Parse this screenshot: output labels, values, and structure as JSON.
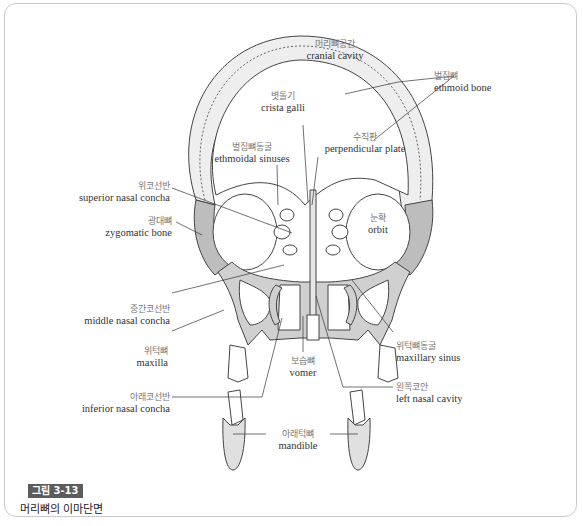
{
  "figure": {
    "badge": "그림 3-13",
    "title": "머리뼈의 이마단면"
  },
  "labels": {
    "cranial_cavity": {
      "ko": "머리뼈공간",
      "en": "cranial cavity"
    },
    "ethmoid_bone": {
      "ko": "벌집뼈",
      "en": "ethmoid bone"
    },
    "crista_galli": {
      "ko": "볏돌기",
      "en": "crista galli"
    },
    "perpendicular_plate": {
      "ko": "수직판",
      "en": "perpendicular plate"
    },
    "ethmoidal_sinuses": {
      "ko": "벌집뼈동굴",
      "en": "ethmoidal sinuses"
    },
    "superior_nasal_concha": {
      "ko": "위코선반",
      "en": "superior nasal concha"
    },
    "zygomatic_bone": {
      "ko": "광대뼈",
      "en": "zygomatic bone"
    },
    "orbit": {
      "ko": "눈확",
      "en": "orbit"
    },
    "middle_nasal_concha": {
      "ko": "중간코선반",
      "en": "middle nasal concha"
    },
    "maxilla": {
      "ko": "위턱뼈",
      "en": "maxilla"
    },
    "maxillary_sinus": {
      "ko": "위턱뼈동굴",
      "en": "maxillary sinus"
    },
    "vomer": {
      "ko": "보습뼈",
      "en": "vomer"
    },
    "left_nasal_cavity": {
      "ko": "왼쪽코안",
      "en": "left nasal cavity"
    },
    "inferior_nasal_concha": {
      "ko": "아래코선반",
      "en": "inferior nasal concha"
    },
    "mandible": {
      "ko": "아래턱뼈",
      "en": "mandible"
    }
  },
  "colors": {
    "bone_fill": "#d0d0d0",
    "bone_stroke": "#444444",
    "badge_bg": "#5c5c5c",
    "frame_border": "#c9c9c9"
  }
}
